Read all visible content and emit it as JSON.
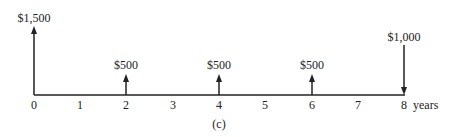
{
  "diagram": {
    "caption": "(c)",
    "axis": {
      "unit_label": "years",
      "ticks": [
        "0",
        "1",
        "2",
        "3",
        "4",
        "5",
        "6",
        "7",
        "8"
      ]
    },
    "cash_flows": [
      {
        "period": 0,
        "label": "$1,500",
        "direction": "up"
      },
      {
        "period": 2,
        "label": "$500",
        "direction": "up"
      },
      {
        "period": 4,
        "label": "$500",
        "direction": "up"
      },
      {
        "period": 6,
        "label": "$500",
        "direction": "up"
      },
      {
        "period": 8,
        "label": "$1,000",
        "direction": "down"
      }
    ],
    "colors": {
      "line": "#222222",
      "background": "#ffffff"
    }
  }
}
